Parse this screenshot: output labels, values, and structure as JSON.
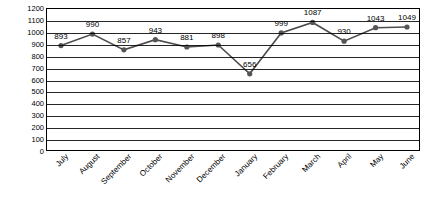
{
  "chart_data": {
    "type": "line",
    "title": "",
    "xlabel": "",
    "ylabel": "Total Number of Visits",
    "categories": [
      "July",
      "August",
      "September",
      "October",
      "November",
      "December",
      "January",
      "February",
      "March",
      "April",
      "May",
      "June"
    ],
    "values": [
      893,
      990,
      857,
      943,
      881,
      898,
      656,
      999,
      1087,
      930,
      1043,
      1049
    ],
    "data_labels": [
      "893",
      "990",
      "857",
      "943",
      "881",
      "898",
      "656",
      "999",
      "1087",
      "930",
      "1043",
      "1049"
    ],
    "ylim": [
      0,
      1200
    ],
    "yticks": [
      0,
      100,
      200,
      300,
      400,
      500,
      600,
      700,
      800,
      900,
      1000,
      1100,
      1200
    ],
    "ytick_labels": [
      "0",
      "100",
      "200",
      "300",
      "400",
      "500",
      "600",
      "700",
      "800",
      "900",
      "1000",
      "1100",
      "1200"
    ],
    "grid": true,
    "legend": "none",
    "series_color": "#4d4d4d",
    "marker_color": "#555555",
    "axis_color": "#000000"
  }
}
